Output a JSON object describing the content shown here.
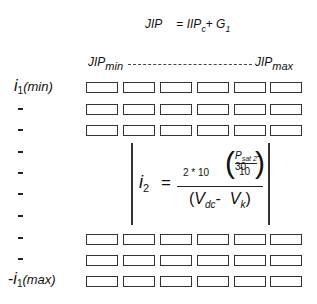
{
  "top_formula": {
    "lhs": "JIP",
    "equals": "=",
    "term1": "IIP",
    "term1_sub": "c",
    "plus": "+",
    "term2": "G",
    "term2_sub": "1"
  },
  "header": {
    "min_label": "JIP",
    "min_sub": "min",
    "max_label": "JIP",
    "max_sub": "max"
  },
  "rows": {
    "first_label": "i",
    "first_sub": "1",
    "first_paren": "(min)",
    "dash": "-",
    "last_prefix": "-",
    "last_label": "i",
    "last_sub": "1",
    "last_paren": "(max)",
    "row_count": 10,
    "columns_count": 6
  },
  "equation": {
    "lhs": "i",
    "lhs_sub": "2",
    "equals": "=",
    "coefficient": "2 * 10",
    "inner_numerator": "P",
    "inner_numerator_sub": "sat 2",
    "inner_minus": "-30",
    "inner_denominator": "10",
    "denominator_open": "(",
    "v1": "V",
    "v1_sub": "dc",
    "minus": "-",
    "v2": "V",
    "v2_sub": "k",
    "denominator_close": ")"
  }
}
